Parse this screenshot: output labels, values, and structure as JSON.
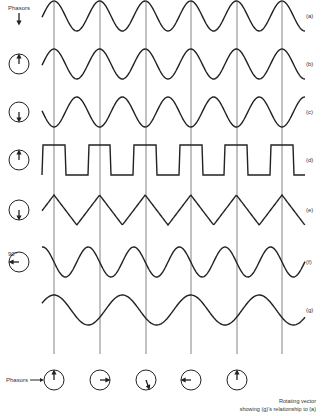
{
  "diagram": {
    "top_label": "Phasors",
    "bottom_label": "Phasors",
    "angle_label": "90°",
    "caption_line1": "Rotating vector",
    "caption_line2": "showing (g)'s relationship to (a)",
    "rows": [
      {
        "label": "(a)",
        "type": "sine",
        "phase": 0,
        "phasor": "down-arrow-only"
      },
      {
        "label": "(b)",
        "type": "sine",
        "phase": 0,
        "phasor": "up"
      },
      {
        "label": "(c)",
        "type": "sine",
        "phase": 180,
        "phasor": "down"
      },
      {
        "label": "(d)",
        "type": "square",
        "phase": 0,
        "phasor": "up"
      },
      {
        "label": "(e)",
        "type": "triangle",
        "phase": 180,
        "phasor": "down"
      },
      {
        "label": "(f)",
        "type": "sine",
        "phase": 90,
        "phasor": "left-90"
      },
      {
        "label": "(g)",
        "type": "sine-slow",
        "phase": 0,
        "phasor": "none"
      }
    ],
    "bottom_phasors": [
      "up",
      "right",
      "down-right",
      "left",
      "up"
    ]
  }
}
